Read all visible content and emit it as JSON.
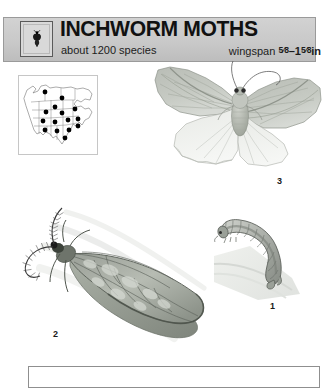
{
  "page": {
    "background_color": "#ffffff",
    "kind": "field-guide-page"
  },
  "header": {
    "title": "INCHWORM MOTHS",
    "subtitle": "about 1200 species",
    "wingspan_label": "wingspan",
    "wingspan_value": "5/8-15/8in",
    "wingspan_min_fraction": "5/8",
    "wingspan_dash": "–",
    "wingspan_max_whole": "1",
    "wingspan_max_fraction": "5/8",
    "wingspan_unit": "in",
    "band_color": "#c9c9c9",
    "border_color": "#9a9a9a",
    "icon": "moth-silhouette-icon"
  },
  "map": {
    "name": "north-america-range-map",
    "region": "North America",
    "dot_color": "#000000",
    "outline_color": "#555555",
    "dot_count": 15,
    "dots": [
      {
        "x": 26,
        "y": 16
      },
      {
        "x": 43,
        "y": 22
      },
      {
        "x": 36,
        "y": 31
      },
      {
        "x": 27,
        "y": 36
      },
      {
        "x": 43,
        "y": 37
      },
      {
        "x": 56,
        "y": 33
      },
      {
        "x": 24,
        "y": 45
      },
      {
        "x": 36,
        "y": 46
      },
      {
        "x": 49,
        "y": 44
      },
      {
        "x": 59,
        "y": 43
      },
      {
        "x": 26,
        "y": 54
      },
      {
        "x": 38,
        "y": 55
      },
      {
        "x": 50,
        "y": 54
      },
      {
        "x": 59,
        "y": 50
      },
      {
        "x": 46,
        "y": 62
      }
    ]
  },
  "figures": [
    {
      "number": "3",
      "name": "adult-moth-wings-spread",
      "caption_number": "3",
      "description": "adult inchworm moth with wings spread, pale grey-green forewings"
    },
    {
      "number": "2",
      "name": "adult-moth-at-rest",
      "caption_number": "2",
      "description": "adult moth at rest with feathery plumose antennae and mottled wing"
    },
    {
      "number": "1",
      "name": "inchworm-caterpillar",
      "caption_number": "1",
      "description": "looping inchworm caterpillar on a twig"
    }
  ],
  "bottom_bar": {
    "name": "bottom-rule-box",
    "border_color": "#8f8f8f"
  }
}
